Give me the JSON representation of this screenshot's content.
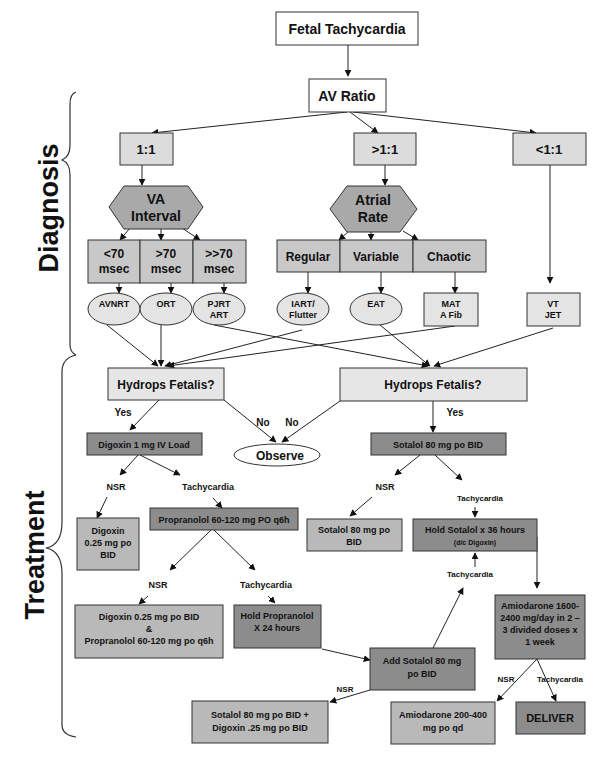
{
  "title": "Fetal Tachycardia",
  "sections": {
    "diagnosis": "Diagnosis",
    "treatment": "Treatment"
  },
  "colors": {
    "white_box": "#ffffff",
    "light_gray": "#dcdcdc",
    "lighter_gray": "#e6e6e6",
    "mid_gray": "#b9b9b9",
    "dark_gray": "#8c8c8c",
    "hex_gray": "#a9a9a9",
    "line": "#222222"
  },
  "nodes": {
    "fetal_tachycardia": "Fetal Tachycardia",
    "av_ratio": "AV Ratio",
    "r_1_1": "1:1",
    "r_gt": ">1:1",
    "r_lt": "<1:1",
    "va_interval": [
      "VA",
      "Interval"
    ],
    "atrial_rate": [
      "Atrial",
      "Rate"
    ],
    "va_lt70": [
      "<70",
      "msec"
    ],
    "va_gt70": [
      ">70",
      "msec"
    ],
    "va_gtgt70": [
      ">>70",
      "msec"
    ],
    "regular": "Regular",
    "variable": "Variable",
    "chaotic": "Chaotic",
    "avnrt": "AVNRT",
    "ort": "ORT",
    "pjrt": [
      "PJRT",
      "ART"
    ],
    "iart": [
      "IART/",
      "Flutter"
    ],
    "eat": "EAT",
    "mat": [
      "MAT",
      "A Fib"
    ],
    "vt": [
      "VT",
      "JET"
    ],
    "hydrops_left": "Hydrops Fetalis?",
    "hydrops_right": "Hydrops Fetalis?",
    "observe": "Observe",
    "digoxin_load": "Digoxin 1 mg IV Load",
    "sotalol_bid": "Sotalol 80 mg po BID",
    "digoxin_025": [
      "Digoxin",
      "0.25 mg po",
      "BID"
    ],
    "propranolol": "Propranolol 60-120 mg PO q6h",
    "sotalol_po": [
      "Sotalol 80 mg po",
      "BID"
    ],
    "hold_sotalol": [
      "Hold Sotalol x 36 hours",
      "(d/c Digoxin)"
    ],
    "dig_prop": [
      "Digoxin 0.25 mg po BID",
      "&",
      "Propranolol 60-120 mg po q6h"
    ],
    "hold_prop": [
      "Hold Propranolol",
      "X 24 hours"
    ],
    "amio_load": [
      "Amiodarone 1600-",
      "2400 mg/day in 2 –",
      "3 divided doses x",
      "1 week"
    ],
    "add_sotalol": [
      "Add Sotalol 80 mg",
      "po BID"
    ],
    "sot_dig": [
      "Sotalol 80 mg po BID +",
      "Digoxin .25 mg po BID"
    ],
    "amio_maint": [
      "Amiodarone 200-400",
      "mg po qd"
    ],
    "deliver": "DELIVER"
  },
  "edge_labels": {
    "yes_left": "Yes",
    "yes_right": "Yes",
    "no_left": "No",
    "no_right": "No",
    "nsr_1": "NSR",
    "tachy_1": "Tachycardia",
    "nsr_2": "NSR",
    "tachy_2": "Tachycardia",
    "nsr_3": "NSR",
    "tachy_3": "Tachycardia",
    "tachy_4": "Tachycardia",
    "nsr_4": "NSR",
    "nsr_5": "NSR",
    "tachy_5": "Tachycardia"
  }
}
